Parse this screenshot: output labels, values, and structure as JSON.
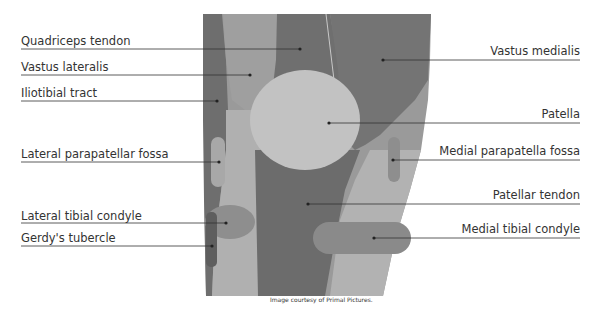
{
  "figure": {
    "credit": "Image courtesy of Primal Pictures."
  },
  "labels_left": [
    {
      "text": "Quadriceps tendon",
      "y": 41
    },
    {
      "text": "Vastus lateralis",
      "y": 67
    },
    {
      "text": "Iliotibial tract",
      "y": 93
    },
    {
      "text": "Lateral parapatellar fossa",
      "y": 156
    },
    {
      "text": "Lateral tibial condyle",
      "y": 217
    },
    {
      "text": "Gerdy's tubercle",
      "y": 239
    }
  ],
  "labels_right": [
    {
      "text": "Vastus medialis",
      "y": 49
    },
    {
      "text": "Patella",
      "y": 113
    },
    {
      "text": "Medial parapatella fossa",
      "y": 150
    },
    {
      "text": "Patellar tendon",
      "y": 185
    },
    {
      "text": "Medial tibial condyle",
      "y": 228
    }
  ],
  "colors": {
    "dark": "#6e6e6e",
    "mid": "#8f8f8f",
    "light": "#b4b4b4",
    "patella": "#c4c4c4",
    "text": "#333333"
  }
}
